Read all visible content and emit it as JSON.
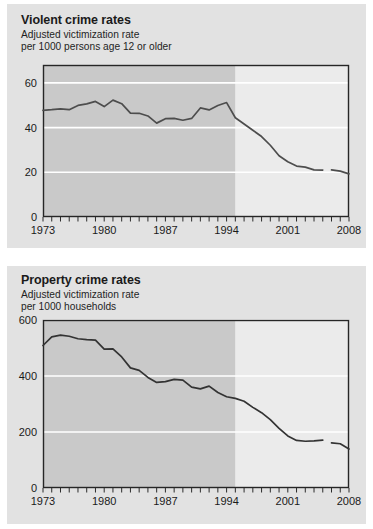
{
  "page": {
    "background_color": "#ffffff",
    "panel_color": "#e2e2e2"
  },
  "charts": [
    {
      "id": "violent-crime-rates",
      "title": "Violent crime rates",
      "subtitle_line1": "Adjusted victimization rate",
      "subtitle_line2": "per 1000 persons age 12 or older"
    },
    {
      "id": "property-crime-rates",
      "title": "Property crime rates",
      "subtitle_line1": "Adjusted victimization rate",
      "subtitle_line2": "per 1000 households"
    }
  ],
  "chart_data": [
    {
      "type": "line",
      "id": "violent-crime-rates",
      "title": "Violent crime rates",
      "subtitle": "Adjusted victimization rate per 1000 persons age 12 or older",
      "xlabel": "",
      "ylabel": "",
      "xlim": [
        1973,
        2008
      ],
      "ylim": [
        0,
        68
      ],
      "yticks": [
        0,
        20,
        40,
        60
      ],
      "ytick_labels": [
        "0",
        "20",
        "40",
        "60"
      ],
      "xticks": [
        1973,
        1980,
        1987,
        1994,
        2001,
        2008
      ],
      "xtick_labels": [
        "1973",
        "1980",
        "1987",
        "1994",
        "2001",
        "2008"
      ],
      "xtick_minor_step": 1,
      "grid": "horizontal-white",
      "legend": "none",
      "shaded_region": {
        "label": "pre-redesign",
        "x_start": 1973,
        "x_end": 1995,
        "color": "#c9c9c9"
      },
      "unshaded_region_color": "#ebebeb",
      "line_color": "#4d4d4d",
      "series_break_between": [
        2005,
        2006
      ],
      "x": [
        1973,
        1974,
        1975,
        1976,
        1977,
        1978,
        1979,
        1980,
        1981,
        1982,
        1983,
        1984,
        1985,
        1986,
        1987,
        1988,
        1989,
        1990,
        1991,
        1992,
        1993,
        1994,
        1995,
        1996,
        1997,
        1998,
        1999,
        2000,
        2001,
        2002,
        2003,
        2004,
        2005,
        2006,
        2007,
        2008
      ],
      "values": [
        47.7,
        48.0,
        48.4,
        48.0,
        49.9,
        50.6,
        51.7,
        49.4,
        52.3,
        50.7,
        46.5,
        46.4,
        45.2,
        42.0,
        44.0,
        44.1,
        43.3,
        44.1,
        48.8,
        47.9,
        49.9,
        51.2,
        44.4,
        41.6,
        38.8,
        36.0,
        32.1,
        27.4,
        24.7,
        22.8,
        22.3,
        21.1,
        21.0,
        21.1,
        20.5,
        19.3
      ]
    },
    {
      "type": "line",
      "id": "property-crime-rates",
      "title": "Property crime rates",
      "subtitle": "Adjusted victimization rate per 1000 households",
      "xlabel": "",
      "ylabel": "",
      "xlim": [
        1973,
        2008
      ],
      "ylim": [
        0,
        600
      ],
      "yticks": [
        0,
        200,
        400,
        600
      ],
      "ytick_labels": [
        "0",
        "200",
        "400",
        "600"
      ],
      "xticks": [
        1973,
        1980,
        1987,
        1994,
        2001,
        2008
      ],
      "xtick_labels": [
        "1973",
        "1980",
        "1987",
        "1994",
        "2001",
        "2008"
      ],
      "xtick_minor_step": 1,
      "grid": "horizontal-white",
      "legend": "none",
      "shaded_region": {
        "label": "pre-redesign",
        "x_start": 1973,
        "x_end": 1995,
        "color": "#c9c9c9"
      },
      "unshaded_region_color": "#ebebeb",
      "line_color": "#333333",
      "series_break_between": [
        2005,
        2006
      ],
      "x": [
        1973,
        1974,
        1975,
        1976,
        1977,
        1978,
        1979,
        1980,
        1981,
        1982,
        1983,
        1984,
        1985,
        1986,
        1987,
        1988,
        1989,
        1990,
        1991,
        1992,
        1993,
        1994,
        1995,
        1996,
        1997,
        1998,
        1999,
        2000,
        2001,
        2002,
        2003,
        2004,
        2005,
        2006,
        2007,
        2008
      ],
      "values": [
        509,
        540,
        546,
        542,
        533,
        530,
        528,
        496,
        497,
        468,
        429,
        420,
        395,
        377,
        380,
        388,
        385,
        360,
        354,
        364,
        341,
        326,
        320,
        310,
        288,
        269,
        244,
        213,
        186,
        170,
        167,
        168,
        171,
        161,
        158,
        139
      ]
    }
  ]
}
